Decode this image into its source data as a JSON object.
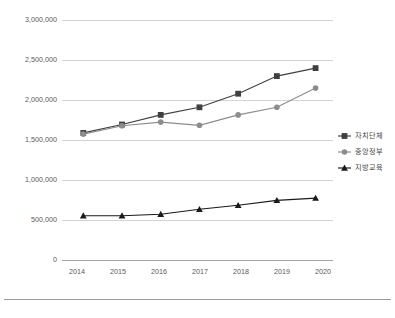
{
  "chart_data": {
    "type": "line",
    "title": "",
    "subtitle": "",
    "xlabel": "",
    "ylabel": "",
    "categories": [
      "2014",
      "2015",
      "2016",
      "2017",
      "2018",
      "2019",
      "2020"
    ],
    "x": [
      2014,
      2015,
      2016,
      2017,
      2018,
      2019,
      2020
    ],
    "ylim": [
      0,
      3000000
    ],
    "yticks": [
      0,
      500000,
      1000000,
      1500000,
      2000000,
      2500000,
      3000000
    ],
    "ytick_labels": [
      "0",
      "500,000",
      "1,000,000",
      "1,500,000",
      "2,000,000",
      "2,500,000",
      "3,000,000"
    ],
    "grid": true,
    "legend_position": "right",
    "series": [
      {
        "name": "자치단체",
        "marker": "square",
        "color": "#404040",
        "values": [
          1595000,
          1700000,
          1820000,
          1915000,
          2085000,
          2305000,
          2405000
        ]
      },
      {
        "name": "중앙정부",
        "marker": "circle",
        "color": "#8c8c8c",
        "values": [
          1580000,
          1685000,
          1730000,
          1690000,
          1820000,
          1915000,
          2155000
        ]
      },
      {
        "name": "지방교육",
        "marker": "triangle",
        "color": "#1a1a1a",
        "values": [
          560000,
          560000,
          578000,
          640000,
          690000,
          752000,
          780000
        ]
      }
    ]
  },
  "axis": {
    "y_tick_labels": [
      "3,000,000",
      "2,500,000",
      "2,000,000",
      "1,500,000",
      "1,000,000",
      "500,000",
      "0"
    ],
    "x_tick_labels": [
      "2014",
      "2015",
      "2016",
      "2017",
      "2018",
      "2019",
      "2020"
    ]
  },
  "legend": {
    "items": [
      {
        "label": "자치단체",
        "color": "#404040",
        "marker": "square"
      },
      {
        "label": "중앙정부",
        "color": "#8c8c8c",
        "marker": "circle"
      },
      {
        "label": "지방교육",
        "color": "#1a1a1a",
        "marker": "triangle"
      }
    ]
  },
  "colors": {
    "background": "#ffffff",
    "gridline": "#c8c8c8",
    "axis": "#9a9a9a",
    "text": "#595959",
    "rule": "#9b9b9b"
  }
}
